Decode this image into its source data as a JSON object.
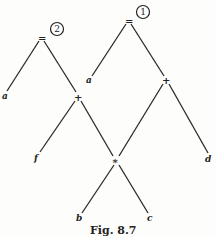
{
  "caption": "Fig. 8.7",
  "trees": [
    {
      "order": "2",
      "root": "=",
      "nodes": {
        "assign": "=",
        "lhs": "a",
        "plus": "+",
        "plus_left": "f",
        "times": "*"
      }
    },
    {
      "order": "1",
      "root": "=",
      "nodes": {
        "assign": "=",
        "lhs": "a",
        "plus": "+",
        "plus_right": "d",
        "times": "*"
      }
    }
  ],
  "shared": {
    "times": "*",
    "b": "b",
    "c": "c"
  },
  "labels": {
    "t2_eq": "=",
    "t2_num": "2",
    "t2_a": "a",
    "t2_plus": "+",
    "t2_f": "f",
    "t1_eq": "=",
    "t1_num": "1",
    "t1_a": "a",
    "t1_plus": "+",
    "t1_d": "d",
    "times": "*",
    "b": "b",
    "c": "c"
  }
}
